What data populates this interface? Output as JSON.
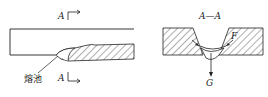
{
  "left_view": {
    "section_mark_top": "A",
    "section_mark_bottom": "A",
    "weld_pool_label": "熔池"
  },
  "right_view": {
    "section_title": "A—A",
    "force_label": "F",
    "gravity_label": "G"
  }
}
